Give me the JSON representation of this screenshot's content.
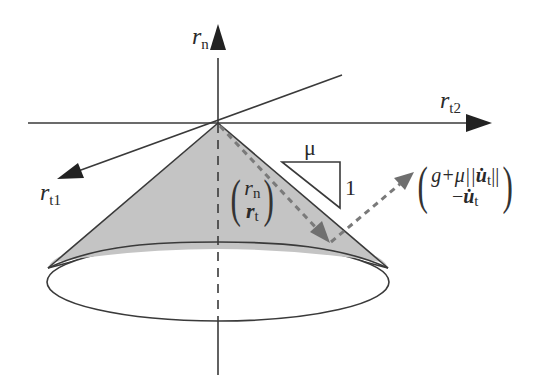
{
  "figure": {
    "colors": {
      "line": "#3a3a3a",
      "cone_fill": "#c4c4c4",
      "dashed_vector": "#7a7a7a",
      "background": "#ffffff"
    }
  },
  "axes": {
    "normal": {
      "symbol": "r",
      "subscript": "n"
    },
    "tangent1": {
      "symbol": "r",
      "subscript": "t1"
    },
    "tangent2": {
      "symbol": "r",
      "subscript": "t2"
    }
  },
  "slope": {
    "run_label": "μ",
    "rise_label": "1"
  },
  "force_vector": {
    "top": {
      "symbol": "r",
      "subscript": "n"
    },
    "bottom": {
      "symbol": "r",
      "subscript": "t"
    }
  },
  "projection_vector": {
    "top_prefix": "g+μ||",
    "top_symbol": "u̇",
    "top_subscript": "t",
    "top_suffix": "||",
    "bottom_prefix": "−",
    "bottom_symbol": "u̇",
    "bottom_subscript": "t"
  }
}
